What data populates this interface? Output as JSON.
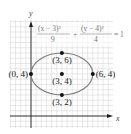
{
  "figure": {
    "type": "ellipse-graph",
    "equation": {
      "term1_numerator": "(x − 3)²",
      "term1_denominator": "9",
      "plus": "+",
      "term2_numerator": "(y − 4)²",
      "term2_denominator": "4",
      "equals": "= 1"
    },
    "axes": {
      "x_label": "x",
      "y_label": "y"
    },
    "ellipse": {
      "center": [
        3,
        4
      ],
      "a": 3,
      "b": 2
    },
    "points": [
      {
        "x": 3,
        "y": 6,
        "label": "(3, 6)",
        "label_pos": "below"
      },
      {
        "x": 0,
        "y": 4,
        "label": "(0, 4)",
        "label_pos": "left"
      },
      {
        "x": 3,
        "y": 4,
        "label": "(3, 4)",
        "label_pos": "below"
      },
      {
        "x": 6,
        "y": 4,
        "label": "(6, 4)",
        "label_pos": "right"
      },
      {
        "x": 3,
        "y": 2,
        "label": "(3, 2)",
        "label_pos": "below"
      }
    ],
    "grid": true,
    "xlim": [
      -2,
      8
    ],
    "ylim": [
      -1,
      9
    ],
    "colors": {
      "grid": "#d9d9d9",
      "ellipse": "#808080",
      "axis": "#222222",
      "point": "#111111"
    }
  }
}
